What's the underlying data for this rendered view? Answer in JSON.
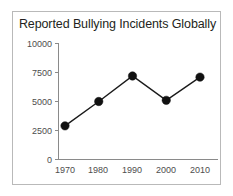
{
  "figure": {
    "border_color": "#b9b9b9",
    "background": "#ffffff"
  },
  "chart_data": {
    "type": "line",
    "title": "Reported Bullying Incidents Globally",
    "xlabel": "",
    "ylabel": "",
    "categories": [
      "1970",
      "1980",
      "1990",
      "2000",
      "2010"
    ],
    "x": [
      1970,
      1980,
      1990,
      2000,
      2010
    ],
    "values": [
      2900,
      5000,
      7200,
      5100,
      7100
    ],
    "series": [
      {
        "name": "Reported bullying incidents",
        "values": [
          2900,
          5000,
          7200,
          5100,
          7100
        ],
        "color": "#111111",
        "marker": "filled-circle"
      }
    ],
    "ylim": [
      0,
      10000
    ],
    "yticks": [
      0,
      2500,
      5000,
      7500,
      10000
    ],
    "ytick_labels": [
      "0",
      "2500",
      "5000",
      "7500",
      "10000"
    ],
    "xtick_labels": [
      "1970",
      "1980",
      "1990",
      "2000",
      "2010"
    ],
    "grid": false,
    "legend": false,
    "legend_position": "none"
  }
}
